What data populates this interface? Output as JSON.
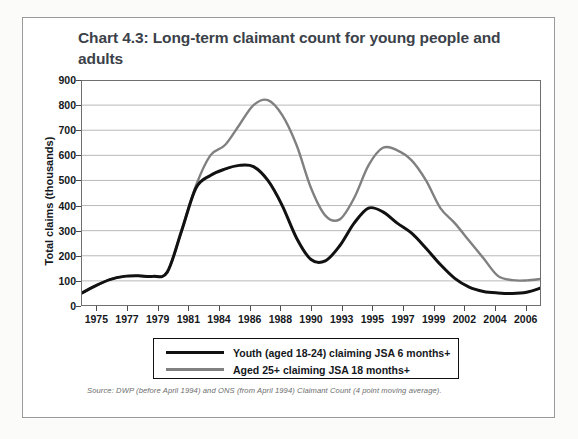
{
  "card": {
    "title": "Chart 4.3: Long-term claimant count for young people and adults",
    "source": "Source: DWP (before April 1994) and ONS (from April 1994) Claimant Count (4 point moving average).",
    "border_color": "#9a9a9a"
  },
  "legend": {
    "items": [
      {
        "label": "Youth (aged 18-24) claiming JSA 6 months+",
        "color": "#111111"
      },
      {
        "label": "Aged 25+ claiming JSA 18 months+",
        "color": "#808080"
      }
    ]
  },
  "chart_data": {
    "type": "line",
    "title": "Chart 4.3: Long-term claimant count for young people and adults",
    "xlabel": "",
    "ylabel": "Total claims (thousands)",
    "ylim": [
      0,
      900
    ],
    "yticks": [
      0,
      100,
      200,
      300,
      400,
      500,
      600,
      700,
      800,
      900
    ],
    "xticklabels": [
      "1975",
      "1977",
      "1979",
      "1981",
      "1984",
      "1986",
      "1988",
      "1990",
      "1993",
      "1995",
      "1997",
      "1999",
      "2002",
      "2004",
      "2006"
    ],
    "grid": true,
    "legend_position": "below-axes",
    "x": [
      1975,
      1976,
      1977,
      1978,
      1979,
      1980,
      1981,
      1982,
      1983,
      1984,
      1985,
      1986,
      1987,
      1988,
      1989,
      1990,
      1991,
      1992,
      1993,
      1994,
      1995,
      1996,
      1997,
      1998,
      1999,
      2000,
      2001,
      2002,
      2003,
      2004,
      2005,
      2006,
      2007
    ],
    "series": [
      {
        "name": "Youth (aged 18-24) claiming JSA 6 months+",
        "color": "#111111",
        "values": [
          50,
          80,
          105,
          118,
          120,
          118,
          135,
          300,
          470,
          520,
          545,
          560,
          555,
          500,
          400,
          270,
          185,
          180,
          240,
          330,
          390,
          375,
          330,
          290,
          230,
          165,
          110,
          75,
          58,
          52,
          50,
          55,
          72
        ]
      },
      {
        "name": "Aged 25+ claiming JSA 18 months+",
        "color": "#808080",
        "values": [
          50,
          80,
          105,
          118,
          120,
          118,
          135,
          300,
          480,
          600,
          640,
          720,
          800,
          820,
          760,
          640,
          470,
          360,
          345,
          430,
          560,
          630,
          620,
          580,
          500,
          390,
          330,
          260,
          190,
          120,
          103,
          102,
          108
        ]
      }
    ]
  }
}
